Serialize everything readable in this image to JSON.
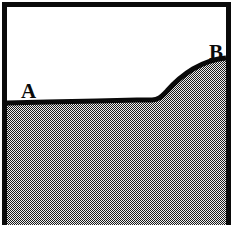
{
  "figure": {
    "width": 238,
    "height": 225,
    "background_color": "#ffffff",
    "frame": {
      "name": "figure-border",
      "color": "#0a0a0a",
      "thickness": 5,
      "sides": "left, top, right",
      "bottom_open": true
    },
    "regions": [
      {
        "id": "upper-region",
        "name": "white-region",
        "fill": "#ffffff",
        "position": "above interface curve"
      },
      {
        "id": "lower-region",
        "name": "stippled-region",
        "fill_pattern": "checkerboard-halftone",
        "pattern_period_px": 2,
        "pattern_dark_color": "#1c1c1c",
        "pattern_light_color": "#e8e8e8",
        "position": "below interface curve"
      }
    ],
    "interface_curve": {
      "name": "interface-curve",
      "color": "#0a0a0a",
      "stroke_width": 5,
      "shape": "flat plateau then rising sigmoid ramp",
      "points": [
        {
          "x": 0,
          "y": 96
        },
        {
          "x": 40,
          "y": 95
        },
        {
          "x": 90,
          "y": 94
        },
        {
          "x": 130,
          "y": 93
        },
        {
          "x": 145,
          "y": 93
        },
        {
          "x": 158,
          "y": 86
        },
        {
          "x": 170,
          "y": 76
        },
        {
          "x": 184,
          "y": 65
        },
        {
          "x": 198,
          "y": 57
        },
        {
          "x": 210,
          "y": 53
        },
        {
          "x": 219,
          "y": 51
        }
      ]
    },
    "labels": [
      {
        "id": "label-a",
        "name": "point-label-a",
        "text": "A",
        "x": 14,
        "y": 74,
        "font_weight": "bold",
        "font_size": 21,
        "color": "#0a0a0a",
        "describes": "left end of flat interface segment"
      },
      {
        "id": "label-b",
        "name": "point-label-b",
        "text": "B",
        "x": 202,
        "y": 35,
        "font_weight": "bold",
        "font_size": 21,
        "color": "#0a0a0a",
        "describes": "upper right end of rising interface curve"
      }
    ]
  }
}
